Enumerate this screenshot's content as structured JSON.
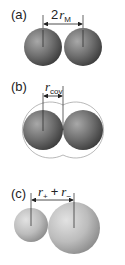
{
  "panels": [
    {
      "label": "(a)",
      "measure": {
        "symbol": "r",
        "prefix": "2",
        "subscript": "M"
      },
      "description": "two touching identical metal atoms"
    },
    {
      "label": "(b)",
      "measure": {
        "symbol": "r",
        "subscript": "cov"
      },
      "description": "two bonded atoms with overlapping outer shells"
    },
    {
      "label": "(c)",
      "measure": {
        "symbol": "r",
        "subscript_1": "+",
        "op": "+",
        "symbol_2": "r",
        "subscript_2": "−"
      },
      "description": "small cation and large anion in contact"
    }
  ],
  "colors": {
    "sphere_dark": "#6e6e6e",
    "sphere_light": "#bdbdbd",
    "line": "#222222",
    "outline": "#9a9a9a"
  }
}
